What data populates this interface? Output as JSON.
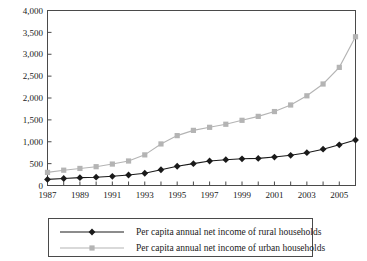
{
  "chart_data": {
    "type": "line",
    "title": "",
    "xlabel": "",
    "ylabel": "",
    "x": [
      1987,
      1988,
      1989,
      1990,
      1991,
      1992,
      1993,
      1994,
      1995,
      1996,
      1997,
      1998,
      1999,
      2000,
      2001,
      2002,
      2003,
      2004,
      2005,
      2006
    ],
    "xlim": [
      1987,
      2006
    ],
    "ylim": [
      0,
      4000
    ],
    "yticks": [
      0,
      500,
      1000,
      1500,
      2000,
      2500,
      3000,
      3500,
      4000
    ],
    "ytick_labels": [
      "0",
      "500",
      "1,000",
      "1,500",
      "2,000",
      "2,500",
      "3,000",
      "3,500",
      "4,000"
    ],
    "xtick_labels": [
      "1987",
      "1989",
      "1991",
      "1993",
      "1995",
      "1997",
      "1999",
      "2001",
      "2003",
      "2005"
    ],
    "xtick_years": [
      1987,
      1989,
      1991,
      1993,
      1995,
      1997,
      1999,
      2001,
      2003,
      2005
    ],
    "grid": false,
    "legend_position": "below",
    "series": [
      {
        "name": "Per capita annual net income of rural households",
        "key": "rural",
        "color": "#1a1a1a",
        "marker": "diamond",
        "values": [
          140,
          160,
          180,
          190,
          210,
          240,
          280,
          360,
          440,
          500,
          560,
          590,
          610,
          620,
          650,
          690,
          750,
          830,
          930,
          1040
        ]
      },
      {
        "name": "Per capita annual net income of urban households",
        "key": "urban",
        "color": "#b4b4b4",
        "marker": "square",
        "values": [
          300,
          350,
          390,
          430,
          490,
          560,
          700,
          950,
          1140,
          1260,
          1330,
          1400,
          1490,
          1580,
          1690,
          1840,
          2050,
          2320,
          2700,
          3400
        ]
      }
    ]
  },
  "legend": {
    "items": [
      {
        "label": "Per capita annual net income of rural households",
        "color": "#1a1a1a",
        "marker": "diamond"
      },
      {
        "label": "Per capita annual net income of urban households",
        "color": "#b4b4b4",
        "marker": "square"
      }
    ]
  }
}
